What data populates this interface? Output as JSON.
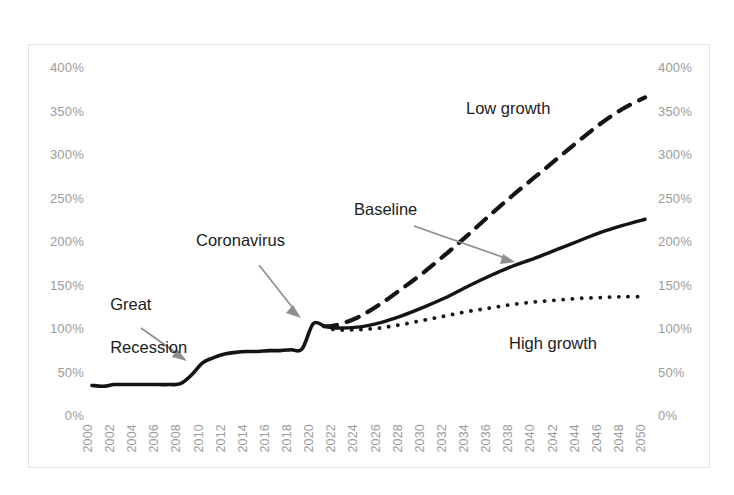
{
  "chart_data": {
    "type": "line",
    "title": "",
    "xlabel": "",
    "ylabel": "",
    "ylim": [
      0,
      400
    ],
    "xlim": [
      2000,
      2050
    ],
    "y_tick_labels": [
      "400%",
      "350%",
      "300%",
      "250%",
      "200%",
      "150%",
      "100%",
      "50%",
      "0%"
    ],
    "y_tick_values": [
      400,
      350,
      300,
      250,
      200,
      150,
      100,
      50,
      0
    ],
    "right_axis": true,
    "right_y_tick_labels": [
      "400%",
      "350%",
      "300%",
      "250%",
      "200%",
      "150%",
      "100%",
      "50%",
      "0%"
    ],
    "grid": false,
    "legend": "none",
    "x_tick_labels": [
      "2000",
      "2002",
      "2004",
      "2006",
      "2008",
      "2010",
      "2012",
      "2014",
      "2016",
      "2018",
      "2020",
      "2022",
      "2024",
      "2026",
      "2028",
      "2030",
      "2032",
      "2034",
      "2036",
      "2038",
      "2040",
      "2042",
      "2044",
      "2046",
      "2048",
      "2050"
    ],
    "x_tick_rotation": -90,
    "series": [
      {
        "name": "Historical",
        "style": "solid",
        "color": "#141414",
        "x": [
          2000,
          2001,
          2002,
          2003,
          2004,
          2005,
          2006,
          2007,
          2008,
          2009,
          2010,
          2011,
          2012,
          2013,
          2014,
          2015,
          2016,
          2017,
          2018,
          2019,
          2020,
          2021
        ],
        "values": [
          34,
          33,
          35,
          35,
          35,
          35,
          35,
          35,
          36,
          46,
          60,
          66,
          70,
          72,
          73,
          73,
          74,
          74,
          75,
          76,
          105,
          102
        ]
      },
      {
        "name": "Baseline",
        "style": "solid",
        "color": "#141414",
        "x": [
          2021,
          2022,
          2024,
          2026,
          2028,
          2030,
          2032,
          2034,
          2036,
          2038,
          2040,
          2042,
          2044,
          2046,
          2048,
          2050
        ],
        "values": [
          102,
          100,
          101,
          106,
          114,
          124,
          135,
          148,
          160,
          171,
          180,
          190,
          200,
          210,
          218,
          225
        ]
      },
      {
        "name": "Low growth",
        "style": "dashed",
        "color": "#141414",
        "x": [
          2021,
          2022,
          2024,
          2026,
          2028,
          2030,
          2032,
          2034,
          2036,
          2038,
          2040,
          2042,
          2044,
          2046,
          2048,
          2050
        ],
        "values": [
          102,
          103,
          112,
          127,
          145,
          164,
          185,
          207,
          230,
          252,
          273,
          294,
          315,
          335,
          352,
          365
        ]
      },
      {
        "name": "High growth",
        "style": "dotted",
        "color": "#141414",
        "x": [
          2021,
          2022,
          2024,
          2026,
          2028,
          2030,
          2032,
          2034,
          2036,
          2038,
          2040,
          2042,
          2044,
          2046,
          2048,
          2050
        ],
        "values": [
          102,
          98,
          98,
          100,
          104,
          109,
          114,
          119,
          123,
          127,
          130,
          132,
          134,
          135,
          136,
          136
        ]
      }
    ],
    "annotations": [
      {
        "text": "Great\nRecession",
        "points_to_year": 2008,
        "points_to_value": 38
      },
      {
        "text": "Coronavirus",
        "points_to_year": 2020,
        "points_to_value": 98
      },
      {
        "text": "Baseline",
        "points_to_year": 2037,
        "points_to_value": 168
      },
      {
        "text": "Low growth",
        "points_to_year": null,
        "points_to_value": null
      },
      {
        "text": "High growth",
        "points_to_year": null,
        "points_to_value": null
      }
    ]
  },
  "annotations": {
    "great_recession_line1": "Great",
    "great_recession_line2": "Recession",
    "coronavirus": "Coronavirus",
    "baseline": "Baseline",
    "low_growth": "Low growth",
    "high_growth": "High growth"
  },
  "axes": {
    "left": [
      "400%",
      "350%",
      "300%",
      "250%",
      "200%",
      "150%",
      "100%",
      "50%",
      "0%"
    ],
    "right": [
      "400%",
      "350%",
      "300%",
      "250%",
      "200%",
      "150%",
      "100%",
      "50%",
      "0%"
    ],
    "years": [
      "2000",
      "2002",
      "2004",
      "2006",
      "2008",
      "2010",
      "2012",
      "2014",
      "2016",
      "2018",
      "2020",
      "2022",
      "2024",
      "2026",
      "2028",
      "2030",
      "2032",
      "2034",
      "2036",
      "2038",
      "2040",
      "2042",
      "2044",
      "2046",
      "2048",
      "2050"
    ]
  },
  "colors": {
    "series": "#141414",
    "axis_text": "#9b9b9b",
    "annotation_text": "#1c1c1c",
    "arrow": "#8e8e8e",
    "frame": "#e2e2e2",
    "background": "#ffffff"
  },
  "title_strip": ""
}
